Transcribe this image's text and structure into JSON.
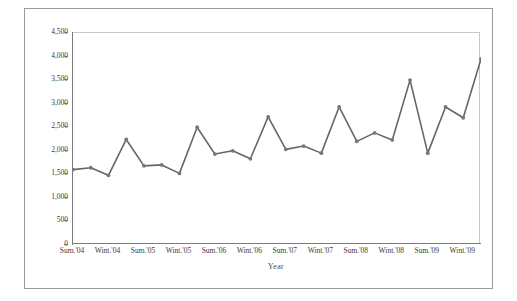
{
  "chart_data": {
    "type": "line",
    "title": "",
    "xlabel": "Year",
    "ylabel": "Sales in Millions",
    "ylim": [
      0,
      4500
    ],
    "ytick_labels": [
      "4,500",
      "4,000",
      "3,500",
      "3,000",
      "2,500",
      "2,000",
      "1,500",
      "1,000",
      "500",
      "0"
    ],
    "ytick_values": [
      4500,
      4000,
      3500,
      3000,
      2500,
      2000,
      1500,
      1000,
      500,
      0
    ],
    "xtick_labels": [
      "Sum.'04",
      "Wint.'04",
      "Sum.'05",
      "Wint.'05",
      "Sum.'06",
      "Wint.'06",
      "Sum.'07",
      "Wint.'07",
      "Sum.'08",
      "Wint.'08",
      "Sum.'09",
      "Wint.'09"
    ],
    "grid": false,
    "legend": "none",
    "markers": true,
    "line_color": "#666666",
    "marker_color": "#777777",
    "values": [
      1600,
      1640,
      1480,
      2240,
      1680,
      1700,
      1520,
      2500,
      1930,
      2000,
      1830,
      2720,
      2030,
      2100,
      1950,
      2930,
      2200,
      2380,
      2230,
      3500,
      1950,
      2930,
      2700,
      3950
    ],
    "x_index": [
      0,
      1,
      2,
      3,
      4,
      5,
      6,
      7,
      8,
      9,
      10,
      11,
      12,
      13,
      14,
      15,
      16,
      17,
      18,
      19,
      20,
      21,
      22,
      23
    ],
    "points_per_label": 2,
    "n_points": 24
  },
  "axis_titles": {
    "y": "Sales in Millions",
    "x": "Year"
  }
}
